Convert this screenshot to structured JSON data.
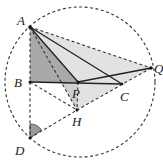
{
  "diagram": {
    "type": "geometry",
    "points": {
      "A": {
        "label": "A",
        "x": 30,
        "y": 27
      },
      "B": {
        "label": "B",
        "x": 30,
        "y": 82
      },
      "P": {
        "label": "P",
        "x": 78,
        "y": 82
      },
      "C": {
        "label": "C",
        "x": 122,
        "y": 84
      },
      "Q": {
        "label": "Q",
        "x": 151,
        "y": 68
      },
      "H": {
        "label": "H",
        "x": 77,
        "y": 110
      },
      "D": {
        "label": "D",
        "x": 30,
        "y": 138
      }
    },
    "circle": {
      "cx": 80,
      "cy": 82,
      "r": 75,
      "style": "dashed"
    },
    "solid_segments": [
      [
        "A",
        "P"
      ],
      [
        "A",
        "C"
      ],
      [
        "B",
        "C"
      ],
      [
        "P",
        "Q"
      ]
    ],
    "dashed_segments": [
      [
        "A",
        "Q"
      ],
      [
        "Q",
        "H"
      ],
      [
        "A",
        "H"
      ],
      [
        "P",
        "H"
      ],
      [
        "B",
        "H"
      ],
      [
        "D",
        "H"
      ],
      [
        "A",
        "D"
      ]
    ],
    "shaded_regions": [
      {
        "vertices": [
          "A",
          "Q",
          "H"
        ],
        "color": "#e2e2e2"
      },
      {
        "vertices": [
          "A",
          "P",
          "H"
        ],
        "color": "#cfcfcf"
      },
      {
        "vertices": [
          "A",
          "B",
          "P"
        ],
        "color": "#a9a9a9"
      }
    ],
    "angle_marks": [
      {
        "vertex": "D",
        "between": [
          "A",
          "H"
        ],
        "color": "#9a9a9a"
      }
    ],
    "labels": {
      "A": "A",
      "B": "B",
      "P": "P",
      "C": "C",
      "Q": "Q",
      "H": "H",
      "D": "D"
    }
  }
}
